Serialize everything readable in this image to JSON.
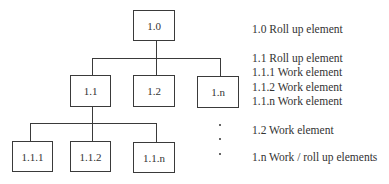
{
  "tree": {
    "root": {
      "label": "1.0"
    },
    "level1": [
      {
        "label": "1.1"
      },
      {
        "label": "1.2"
      },
      {
        "label": "1.n"
      }
    ],
    "level2": [
      {
        "label": "1.1.1"
      },
      {
        "label": "1.1.2"
      },
      {
        "label": "1.1.n"
      }
    ]
  },
  "legend": {
    "items": [
      "1.0 Roll up element",
      "1.1 Roll up element",
      "1.1.1 Work element",
      "1.1.2 Work element",
      "1.1.n Work element",
      "1.2 Work element",
      "1.n Work / roll up elements"
    ],
    "ellipsis_bullets": [
      "•",
      "•",
      "•"
    ]
  }
}
